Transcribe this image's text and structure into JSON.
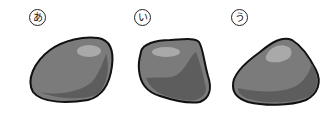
{
  "figure": {
    "labels": [
      "あ",
      "い",
      "う"
    ],
    "items": [
      {
        "label": "あ",
        "description": "rounded elongated stone"
      },
      {
        "label": "い",
        "description": "angular blocky stone"
      },
      {
        "label": "う",
        "description": "rounded triangular stone"
      }
    ],
    "colors": {
      "outline": "#111111",
      "base": "#7b7b7b",
      "highlight": "#a9a9a9",
      "shadow": "#5d5d5d"
    }
  }
}
